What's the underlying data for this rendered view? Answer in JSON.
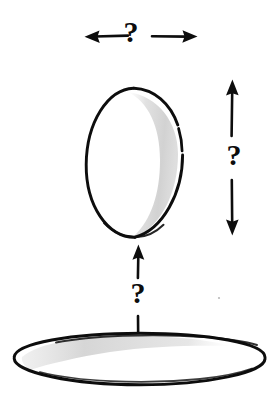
{
  "figure": {
    "style": "hand-drawn ink sketch",
    "background_color": "#ffffff",
    "ink_color": "#0d0d0d",
    "shade_color": "#d8d8d8"
  },
  "labels": {
    "width_question": "?",
    "height_question": "?",
    "gap_question": "?"
  },
  "annotations": [
    {
      "name": "width-dimension",
      "label": "?",
      "orientation": "horizontal",
      "arrow_style": "double-headed-split",
      "measures": "egg-width",
      "span_px": [
        85,
        198
      ],
      "y_px": 36
    },
    {
      "name": "height-dimension",
      "label": "?",
      "orientation": "vertical",
      "arrow_style": "double-headed-split",
      "measures": "egg-height",
      "span_px": [
        80,
        235
      ],
      "x_px": 232
    },
    {
      "name": "gap-dimension",
      "label": "?",
      "orientation": "vertical",
      "arrow_style": "double-headed-split",
      "measures": "gap-between-egg-and-nest",
      "span_px": [
        245,
        362
      ],
      "x_px": 138
    }
  ],
  "shapes": [
    {
      "name": "egg",
      "type": "egg-oval",
      "bbox_px": [
        86,
        88,
        183,
        238
      ],
      "fill": "#ffffff",
      "stroke": "#0d0d0d",
      "shading": "crescent-right-inner"
    },
    {
      "name": "nest-ring",
      "type": "ellipse",
      "bbox_px": [
        14,
        333,
        265,
        385
      ],
      "fill": "#ffffff",
      "stroke": "#0d0d0d",
      "shading": "crescent-upper-left-inner"
    }
  ]
}
